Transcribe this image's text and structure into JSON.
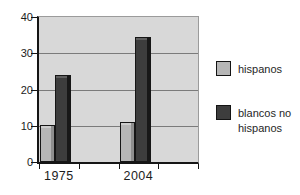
{
  "chart_data": {
    "type": "bar",
    "title": "",
    "xlabel": "",
    "ylabel": "",
    "categories": [
      "1975",
      "2004"
    ],
    "series": [
      {
        "name": "hispanos",
        "values": [
          10.3,
          11
        ],
        "color": "#b6b6b6",
        "side_color": "#8f8f8f",
        "top_color": "#cdcdcd"
      },
      {
        "name": "blancos no hispanos",
        "values": [
          24,
          34.6
        ],
        "color": "#3d3d3d",
        "side_color": "#181818",
        "top_color": "#5f5f5f"
      }
    ],
    "ylim": [
      0,
      40
    ],
    "yticks": [
      0,
      10,
      20,
      30,
      40
    ],
    "grid": true,
    "grid_color": "#7b7b7b",
    "plot_bg": "#d8d8d8",
    "axis_color": "#151515",
    "text_color": "#1c1c1c",
    "legend_position": "right"
  }
}
